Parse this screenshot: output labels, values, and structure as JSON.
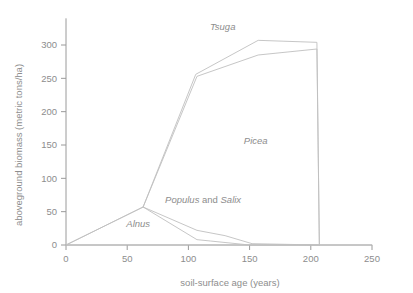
{
  "chart_data": {
    "type": "area",
    "title": "",
    "subtitle": "",
    "xlabel": "soil-surface age (years)",
    "ylabel": "aboveground biomass (metric tons/ha)",
    "xlim": [
      0,
      250
    ],
    "ylim": [
      0,
      340
    ],
    "xticks": [
      0,
      50,
      100,
      150,
      200,
      250
    ],
    "yticks": [
      0,
      50,
      100,
      150,
      200,
      250,
      300
    ],
    "xtick_labels": [
      "0",
      "50",
      "100",
      "150",
      "200",
      "250"
    ],
    "ytick_labels": [
      "0",
      "50",
      "100",
      "150",
      "200",
      "250",
      "300"
    ],
    "grid": false,
    "legend": "inline-annotations",
    "line_color": "#c0c0c0",
    "axis_color": "#9a9a9a",
    "text_color": "#8d8d8d",
    "background": "#ffffff",
    "annotations": [
      {
        "name": "Tsuga",
        "text": "Tsuga",
        "italic": true,
        "x": 128,
        "y": 322
      },
      {
        "name": "Picea",
        "text": "Picea",
        "italic": true,
        "x": 155,
        "y": 152
      },
      {
        "name": "Alnus",
        "text": "Alnus",
        "italic": true,
        "x": 59,
        "y": 27
      },
      {
        "name": "Populus and Salix",
        "text_parts": [
          "Populus",
          " and ",
          "Salix"
        ],
        "italic_parts": [
          true,
          false,
          true
        ],
        "x": 112,
        "y": 63
      }
    ],
    "series": [
      {
        "name": "boundary-lower-populus-salix",
        "points": [
          [
            0,
            0
          ],
          [
            63,
            57
          ],
          [
            107,
            8
          ],
          [
            118,
            6
          ],
          [
            150,
            0
          ],
          [
            207,
            0
          ]
        ]
      },
      {
        "name": "boundary-upper-populus-salix",
        "points": [
          [
            0,
            0
          ],
          [
            63,
            57
          ],
          [
            107,
            22
          ],
          [
            130,
            14
          ],
          [
            152,
            2
          ],
          [
            207,
            0
          ]
        ]
      },
      {
        "name": "boundary-picea-top",
        "points": [
          [
            63,
            57
          ],
          [
            107,
            253
          ],
          [
            157,
            285
          ],
          [
            205,
            294
          ],
          [
            207,
            0
          ]
        ]
      },
      {
        "name": "boundary-tsuga-top",
        "points": [
          [
            63,
            57
          ],
          [
            106,
            256
          ],
          [
            157,
            307
          ],
          [
            205,
            304
          ],
          [
            207,
            0
          ]
        ]
      },
      {
        "name": "baseline-zero",
        "points": [
          [
            0,
            0
          ],
          [
            250,
            0
          ]
        ]
      }
    ]
  },
  "axes": {
    "x_title": "soil-surface age (years)",
    "y_title": "aboveground biomass (metric tons/ha)"
  }
}
